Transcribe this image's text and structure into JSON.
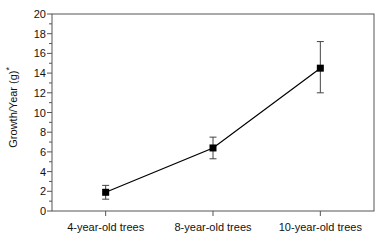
{
  "chart_data": {
    "type": "line",
    "title": "",
    "xlabel": "",
    "ylabel": "Growth/Year (g)*",
    "ylabel_text": "Growth/Year (g)",
    "ylabel_superscript": "*",
    "categories": [
      "4-year-old trees",
      "8-year-old trees",
      "10-year-old trees"
    ],
    "values": [
      1.9,
      6.4,
      14.5
    ],
    "errors": [
      0.7,
      1.1,
      2.5
    ],
    "error_low": [
      1.2,
      5.3,
      12.0
    ],
    "error_high": [
      2.6,
      7.5,
      17.2
    ],
    "ylim": [
      0,
      20
    ],
    "ytick_values": [
      0,
      2,
      4,
      6,
      8,
      10,
      12,
      14,
      16,
      18,
      20
    ],
    "ytick_labels": [
      "0",
      "2",
      "4",
      "6",
      "8",
      "10",
      "12",
      "14",
      "16",
      "18",
      "20"
    ],
    "grid": false,
    "legend": false,
    "legend_position": "none",
    "marker": "square",
    "marker_color": "#000000",
    "line_color": "#000000",
    "frame_color": "#555555",
    "background_color": "#ffffff"
  }
}
